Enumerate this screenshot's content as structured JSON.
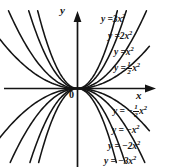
{
  "figure": {
    "background": "#ffffff",
    "ink": "#141414",
    "origin_label": "0",
    "axes": {
      "x_label": "x",
      "y_label": "y",
      "x_arrow": "arrow-right",
      "y_arrow": "arrow-up"
    }
  },
  "chart_data": {
    "type": "line",
    "title": "",
    "xlabel": "x",
    "ylabel": "y",
    "grid": false,
    "legend": "inline-curve-labels",
    "xlim": [
      -2.55,
      1.82
    ],
    "ylim": [
      -2.9,
      3.05
    ],
    "origin_label": "0",
    "note": "Family of parabolas y = a x^2 drawn through the origin; positive a open upward, negative a open downward.",
    "series": [
      {
        "name": "y = 3x^2",
        "a": 3,
        "label_parts": {
          "lhs": "y =",
          "coef": "3",
          "var": "x",
          "power": "2",
          "sign": "+",
          "fraction": null
        }
      },
      {
        "name": "y = 2x^2",
        "a": 2,
        "label_parts": {
          "lhs": "y =",
          "coef": "2",
          "var": "x",
          "power": "2",
          "sign": "+",
          "fraction": null
        }
      },
      {
        "name": "y = x^2",
        "a": 1,
        "label_parts": {
          "lhs": "y =",
          "coef": "",
          "var": "x",
          "power": "2",
          "sign": "+",
          "fraction": null
        }
      },
      {
        "name": "y = 1/2 x^2",
        "a": 0.5,
        "label_parts": {
          "lhs": "y =",
          "coef": "",
          "var": "x",
          "power": "2",
          "sign": "+",
          "fraction": {
            "num": "1",
            "den": "2"
          }
        }
      },
      {
        "name": "y = -1/2 x^2",
        "a": -0.5,
        "label_parts": {
          "lhs": "y =",
          "coef": "",
          "var": "x",
          "power": "2",
          "sign": "−",
          "fraction": {
            "num": "1",
            "den": "2"
          }
        }
      },
      {
        "name": "y = -x^2",
        "a": -1,
        "label_parts": {
          "lhs": "y =",
          "coef": "",
          "var": "x",
          "power": "2",
          "sign": "−",
          "fraction": null
        }
      },
      {
        "name": "y = -2x^2",
        "a": -2,
        "label_parts": {
          "lhs": "y =",
          "coef": "2",
          "var": "x",
          "power": "2",
          "sign": "−",
          "fraction": null
        }
      },
      {
        "name": "y = -3x^2",
        "a": -3,
        "label_parts": {
          "lhs": "y =",
          "coef": "3",
          "var": "x",
          "power": "2",
          "sign": "−",
          "fraction": null
        }
      }
    ]
  },
  "labels": {
    "y_axis": "y",
    "x_axis": "x",
    "origin": "0",
    "eq_3x2": {
      "pre": "y =",
      "coef": "3",
      "var": "x",
      "sup": "2"
    },
    "eq_2x2": {
      "pre": "y =",
      "coef": "2",
      "var": "x",
      "sup": "2"
    },
    "eq_x2": {
      "pre": "y =",
      "coef": "",
      "var": "x",
      "sup": "2"
    },
    "eq_half": {
      "pre": "y =",
      "num": "1",
      "den": "2",
      "var": "x",
      "sup": "2"
    },
    "eq_nhalf": {
      "pre": "y = −",
      "num": "1",
      "den": "2",
      "var": "x",
      "sup": "2"
    },
    "eq_nx2": {
      "pre": "y = −",
      "coef": "",
      "var": "x",
      "sup": "2"
    },
    "eq_n2x2": {
      "pre": "y = −",
      "coef": "2",
      "var": "x",
      "sup": "2"
    },
    "eq_n3x2": {
      "pre": "y = −",
      "coef": "3",
      "var": "x",
      "sup": "2"
    }
  }
}
